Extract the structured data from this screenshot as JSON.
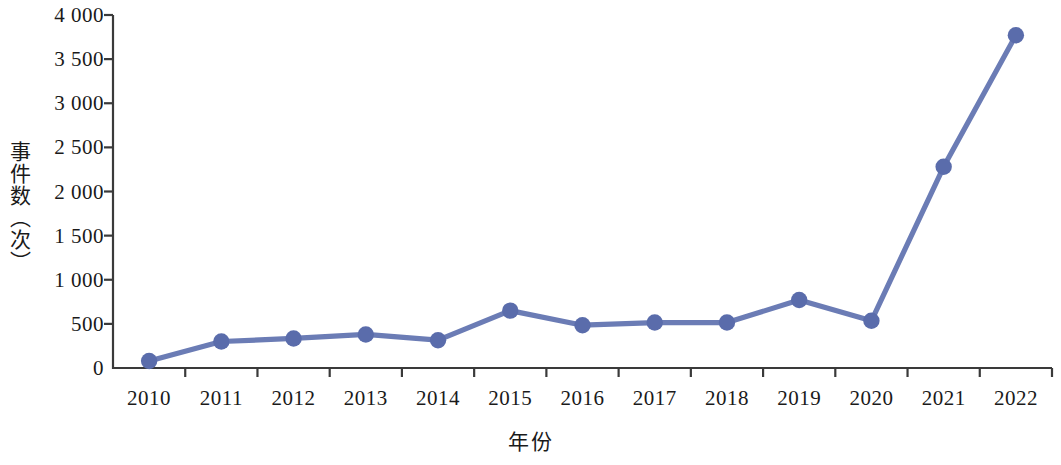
{
  "chart_data": {
    "type": "line",
    "title": "",
    "subtitle": "",
    "xlabel": "年份",
    "ylabel": "事件数（次）",
    "categories": [
      "2010",
      "2011",
      "2012",
      "2013",
      "2014",
      "2015",
      "2016",
      "2017",
      "2018",
      "2019",
      "2020",
      "2021",
      "2022"
    ],
    "values": [
      80,
      300,
      335,
      380,
      315,
      650,
      485,
      515,
      515,
      770,
      535,
      2280,
      3770
    ],
    "series": [
      {
        "name": "事件数",
        "values": [
          80,
          300,
          335,
          380,
          315,
          650,
          485,
          515,
          515,
          770,
          535,
          2280,
          3770
        ]
      }
    ],
    "ylim": [
      0,
      4000
    ],
    "y_ticks": [
      0,
      500,
      1000,
      1500,
      2000,
      2500,
      3000,
      3500,
      4000
    ],
    "y_tick_labels": [
      "0",
      "500",
      "1 000",
      "1 500",
      "2 000",
      "2 500",
      "3 000",
      "3 500",
      "4 000"
    ],
    "grid": false,
    "legend": "none",
    "marker": "circle",
    "line_color": "#6b7cb5",
    "marker_color": "#5a6cab",
    "axis_color": "#3a3a3a",
    "background": "#ffffff"
  },
  "axes": {
    "y_title": "事件数（次）",
    "x_title": "年份"
  }
}
